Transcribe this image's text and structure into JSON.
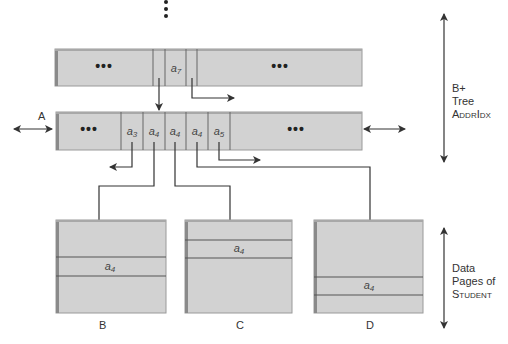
{
  "diagram": {
    "title_side_labels": {
      "btree_line1": "B+",
      "btree_line2": "Tree",
      "btree_line3": "AddrIdx",
      "pages_line1": "Data",
      "pages_line2": "Pages of",
      "pages_line3": "Student"
    },
    "top_node": {
      "left_ellipsis": "•••",
      "right_ellipsis": "•••",
      "key": "a",
      "key_sub": "7"
    },
    "leaf_node": {
      "label": "A",
      "left_ellipsis": "•••",
      "right_ellipsis": "•••",
      "keys": [
        {
          "base": "a",
          "sub": "3"
        },
        {
          "base": "a",
          "sub": "4"
        },
        {
          "base": "a",
          "sub": "4"
        },
        {
          "base": "a",
          "sub": "4"
        },
        {
          "base": "a",
          "sub": "5"
        }
      ]
    },
    "pages": [
      {
        "label": "B",
        "record": "a",
        "record_sub": "4"
      },
      {
        "label": "C",
        "record": "a",
        "record_sub": "4"
      },
      {
        "label": "D",
        "record": "a",
        "record_sub": "4"
      }
    ],
    "colors": {
      "fill": "#d2d2d2",
      "edge": "#8a8a8a",
      "line": "#333333"
    }
  }
}
